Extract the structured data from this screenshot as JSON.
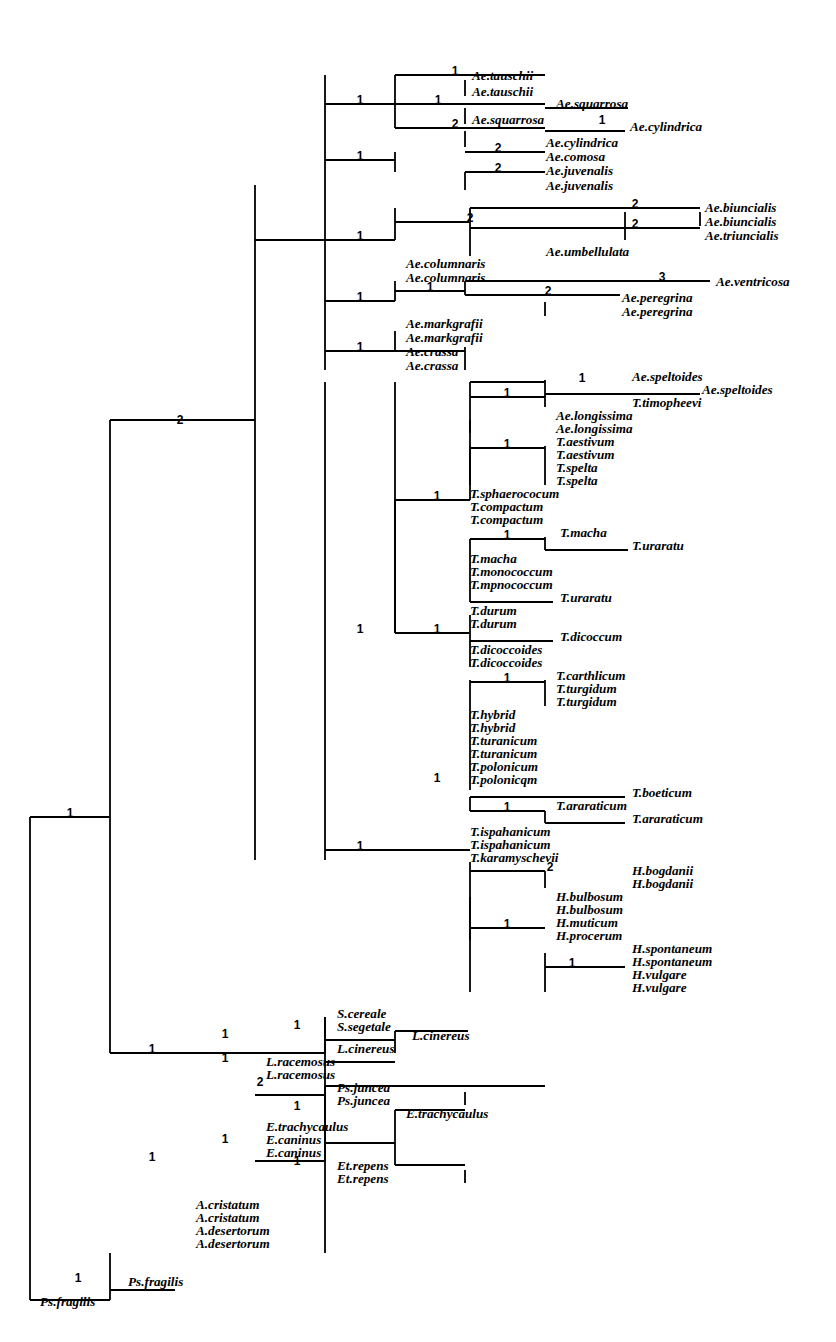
{
  "figure": {
    "type": "phylogenetic-cladogram",
    "orientation": "rectangular-left-to-right",
    "line_color": "#000000",
    "background_color": "#ffffff",
    "branch_length_unit": "steps",
    "tip_count": 78,
    "branch_number_count": 45
  },
  "taxa": [
    {
      "id": "t1",
      "label": "Ae.tauschii",
      "x": 472,
      "y": 80
    },
    {
      "id": "t2",
      "label": "Ae.tauschii",
      "x": 472,
      "y": 96
    },
    {
      "id": "t3",
      "label": "Ae.squarrosa",
      "x": 556,
      "y": 108
    },
    {
      "id": "t4",
      "label": "Ae.squarrosa",
      "x": 472,
      "y": 124
    },
    {
      "id": "t5",
      "label": "Ae.cylindrica",
      "x": 630,
      "y": 131
    },
    {
      "id": "t6",
      "label": "Ae.cylindrica",
      "x": 546,
      "y": 147
    },
    {
      "id": "t7",
      "label": "Ae.comosa",
      "x": 546,
      "y": 161
    },
    {
      "id": "t8",
      "label": "Ae.juvenalis",
      "x": 546,
      "y": 175
    },
    {
      "id": "t9",
      "label": "Ae.juvenalis",
      "x": 546,
      "y": 190
    },
    {
      "id": "t10",
      "label": "Ae.biuncialis",
      "x": 705,
      "y": 212
    },
    {
      "id": "t11",
      "label": "Ae.biuncialis",
      "x": 705,
      "y": 226
    },
    {
      "id": "t12",
      "label": "Ae.triuncialis",
      "x": 705,
      "y": 240
    },
    {
      "id": "t13",
      "label": "Ae.umbellulata",
      "x": 546,
      "y": 256
    },
    {
      "id": "t14",
      "label": "Ae.columnaris",
      "x": 406,
      "y": 268
    },
    {
      "id": "t15",
      "label": "Ae.columnaris",
      "x": 406,
      "y": 282
    },
    {
      "id": "t16",
      "label": "Ae.ventricosa",
      "x": 716,
      "y": 286
    },
    {
      "id": "t17",
      "label": "Ae.peregrina",
      "x": 622,
      "y": 302
    },
    {
      "id": "t18",
      "label": "Ae.peregrina",
      "x": 622,
      "y": 316
    },
    {
      "id": "t19",
      "label": "Ae.markgrafii",
      "x": 406,
      "y": 328
    },
    {
      "id": "t20",
      "label": "Ae.markgrafii",
      "x": 406,
      "y": 342
    },
    {
      "id": "t21",
      "label": "Ae.crassa",
      "x": 406,
      "y": 356
    },
    {
      "id": "t22",
      "label": "Ae.crassa",
      "x": 406,
      "y": 370
    },
    {
      "id": "t23",
      "label": "Ae.speltoides",
      "x": 632,
      "y": 381
    },
    {
      "id": "t24",
      "label": "Ae.speltoides",
      "x": 702,
      "y": 394
    },
    {
      "id": "t25",
      "label": "T.timopheevi",
      "x": 632,
      "y": 407
    },
    {
      "id": "t26",
      "label": "Ae.longissima",
      "x": 556,
      "y": 420
    },
    {
      "id": "t27",
      "label": "Ae.longissima",
      "x": 556,
      "y": 433
    },
    {
      "id": "t28",
      "label": "T.aestivum",
      "x": 556,
      "y": 446
    },
    {
      "id": "t29",
      "label": "T.aestivum",
      "x": 556,
      "y": 459
    },
    {
      "id": "t30",
      "label": "T.spelta",
      "x": 556,
      "y": 472
    },
    {
      "id": "t31",
      "label": "T.spelta",
      "x": 556,
      "y": 485
    },
    {
      "id": "t32",
      "label": "T.sphaerococum",
      "x": 470,
      "y": 498
    },
    {
      "id": "t33",
      "label": "T.compactum",
      "x": 470,
      "y": 511
    },
    {
      "id": "t34",
      "label": "T.compactum",
      "x": 470,
      "y": 524
    },
    {
      "id": "t35",
      "label": "T.macha",
      "x": 560,
      "y": 537
    },
    {
      "id": "t36",
      "label": "T.uraratu",
      "x": 632,
      "y": 550
    },
    {
      "id": "t37",
      "label": "T.macha",
      "x": 470,
      "y": 563
    },
    {
      "id": "t38",
      "label": "T.monococcum",
      "x": 470,
      "y": 576
    },
    {
      "id": "t39",
      "label": "T.mpnococcum",
      "x": 470,
      "y": 589
    },
    {
      "id": "t40",
      "label": "T.uraratu",
      "x": 560,
      "y": 602
    },
    {
      "id": "t41",
      "label": "T.durum",
      "x": 470,
      "y": 615
    },
    {
      "id": "t42",
      "label": "T.durum",
      "x": 470,
      "y": 628
    },
    {
      "id": "t43",
      "label": "T.dicoccum",
      "x": 560,
      "y": 641
    },
    {
      "id": "t44",
      "label": "T.dicoccoides",
      "x": 470,
      "y": 654
    },
    {
      "id": "t45",
      "label": "T.dicoccoides",
      "x": 470,
      "y": 667
    },
    {
      "id": "t46",
      "label": "T.carthlicum",
      "x": 556,
      "y": 680
    },
    {
      "id": "t47",
      "label": "T.turgidum",
      "x": 556,
      "y": 693
    },
    {
      "id": "t48",
      "label": "T.turgidum",
      "x": 556,
      "y": 706
    },
    {
      "id": "t49",
      "label": "T.hybrid",
      "x": 470,
      "y": 719
    },
    {
      "id": "t50",
      "label": "T.hybrid",
      "x": 470,
      "y": 732
    },
    {
      "id": "t51",
      "label": "T.turanicum",
      "x": 470,
      "y": 745
    },
    {
      "id": "t52",
      "label": "T.turanicum",
      "x": 470,
      "y": 758
    },
    {
      "id": "t53",
      "label": "T.polonicum",
      "x": 470,
      "y": 771
    },
    {
      "id": "t54",
      "label": "T.polonicqm",
      "x": 470,
      "y": 784
    },
    {
      "id": "t55",
      "label": "T.boeticum",
      "x": 632,
      "y": 797
    },
    {
      "id": "t56",
      "label": "T.araraticum",
      "x": 556,
      "y": 810
    },
    {
      "id": "t57",
      "label": "T.araraticum",
      "x": 632,
      "y": 823
    },
    {
      "id": "t58",
      "label": "T.ispahanicum",
      "x": 470,
      "y": 836
    },
    {
      "id": "t59",
      "label": "T.ispahanicum",
      "x": 470,
      "y": 849
    },
    {
      "id": "t60",
      "label": "T.karamyschevii",
      "x": 470,
      "y": 862
    },
    {
      "id": "t61",
      "label": "H.bogdanii",
      "x": 632,
      "y": 875
    },
    {
      "id": "t62",
      "label": "H.bogdanii",
      "x": 632,
      "y": 888
    },
    {
      "id": "t63",
      "label": "H.bulbosum",
      "x": 556,
      "y": 901
    },
    {
      "id": "t64",
      "label": "H.bulbosum",
      "x": 556,
      "y": 914
    },
    {
      "id": "t65",
      "label": "H.muticum",
      "x": 556,
      "y": 927
    },
    {
      "id": "t66",
      "label": "H.procerum",
      "x": 556,
      "y": 940
    },
    {
      "id": "t67",
      "label": "H.spontaneum",
      "x": 632,
      "y": 953
    },
    {
      "id": "t68",
      "label": "H.spontaneum",
      "x": 632,
      "y": 966
    },
    {
      "id": "t69",
      "label": "H.vulgare",
      "x": 632,
      "y": 979
    },
    {
      "id": "t70",
      "label": "H.vulgare",
      "x": 632,
      "y": 992
    },
    {
      "id": "t71",
      "label": "S.cereale",
      "x": 337,
      "y": 1018
    },
    {
      "id": "t72",
      "label": "S.segetale",
      "x": 337,
      "y": 1031
    },
    {
      "id": "t73",
      "label": "L.cinereus",
      "x": 412,
      "y": 1040
    },
    {
      "id": "t74",
      "label": "L.cinereus",
      "x": 337,
      "y": 1053
    },
    {
      "id": "t75",
      "label": "L.racemosus",
      "x": 266,
      "y": 1066
    },
    {
      "id": "t76",
      "label": "L.racemosus",
      "x": 266,
      "y": 1079
    },
    {
      "id": "t77",
      "label": "Ps.juncea",
      "x": 337,
      "y": 1092
    },
    {
      "id": "t78",
      "label": "Ps.juncea",
      "x": 337,
      "y": 1105
    },
    {
      "id": "t79",
      "label": "E.trachycaulus",
      "x": 406,
      "y": 1118
    },
    {
      "id": "t80",
      "label": "E.trachycaulus",
      "x": 266,
      "y": 1131
    },
    {
      "id": "t81",
      "label": "E.caninus",
      "x": 266,
      "y": 1144
    },
    {
      "id": "t82",
      "label": "E.caninus",
      "x": 266,
      "y": 1157
    },
    {
      "id": "t83",
      "label": "Et.repens",
      "x": 337,
      "y": 1170
    },
    {
      "id": "t84",
      "label": "Et.repens",
      "x": 337,
      "y": 1183
    },
    {
      "id": "t85",
      "label": "A.cristatum",
      "x": 196,
      "y": 1209
    },
    {
      "id": "t86",
      "label": "A.cristatum",
      "x": 196,
      "y": 1222
    },
    {
      "id": "t87",
      "label": "A.desertorum",
      "x": 196,
      "y": 1235
    },
    {
      "id": "t88",
      "label": "A.desertorum",
      "x": 196,
      "y": 1248
    },
    {
      "id": "t89",
      "label": "Ps.fragilis",
      "x": 128,
      "y": 1286
    },
    {
      "id": "t90",
      "label": "Ps.fragilis",
      "x": 40,
      "y": 1306
    }
  ],
  "branch_numbers": [
    {
      "id": "n1",
      "label": "1",
      "x": 455,
      "y": 75
    },
    {
      "id": "n2",
      "label": "1",
      "x": 360,
      "y": 104
    },
    {
      "id": "n3",
      "label": "1",
      "x": 438,
      "y": 104
    },
    {
      "id": "n4",
      "label": "2",
      "x": 455,
      "y": 128
    },
    {
      "id": "n5",
      "label": "1",
      "x": 602,
      "y": 124
    },
    {
      "id": "n6",
      "label": "2",
      "x": 498,
      "y": 152
    },
    {
      "id": "n7",
      "label": "1",
      "x": 360,
      "y": 160
    },
    {
      "id": "n8",
      "label": "2",
      "x": 498,
      "y": 172
    },
    {
      "id": "n9",
      "label": "2",
      "x": 635,
      "y": 208
    },
    {
      "id": "n10",
      "label": "2",
      "x": 635,
      "y": 228
    },
    {
      "id": "n11",
      "label": "2",
      "x": 470,
      "y": 222
    },
    {
      "id": "n12",
      "label": "1",
      "x": 360,
      "y": 240
    },
    {
      "id": "n13",
      "label": "3",
      "x": 662,
      "y": 281
    },
    {
      "id": "n14",
      "label": "2",
      "x": 548,
      "y": 295
    },
    {
      "id": "n15",
      "label": "1",
      "x": 430,
      "y": 291
    },
    {
      "id": "n16",
      "label": "1",
      "x": 360,
      "y": 301
    },
    {
      "id": "n17",
      "label": "1",
      "x": 360,
      "y": 351
    },
    {
      "id": "n18",
      "label": "1",
      "x": 582,
      "y": 382
    },
    {
      "id": "n19",
      "label": "1",
      "x": 507,
      "y": 397
    },
    {
      "id": "n20",
      "label": "1",
      "x": 507,
      "y": 448
    },
    {
      "id": "n21",
      "label": "1",
      "x": 437,
      "y": 500
    },
    {
      "id": "n22",
      "label": "1",
      "x": 507,
      "y": 539
    },
    {
      "id": "n23",
      "label": "1",
      "x": 360,
      "y": 633
    },
    {
      "id": "n24",
      "label": "1",
      "x": 437,
      "y": 633
    },
    {
      "id": "n25",
      "label": "1",
      "x": 507,
      "y": 682
    },
    {
      "id": "n26",
      "label": "1",
      "x": 437,
      "y": 782
    },
    {
      "id": "n27",
      "label": "1",
      "x": 507,
      "y": 811
    },
    {
      "id": "n28",
      "label": "2",
      "x": 550,
      "y": 871
    },
    {
      "id": "n29",
      "label": "1",
      "x": 507,
      "y": 928
    },
    {
      "id": "n30",
      "label": "1",
      "x": 572,
      "y": 967
    },
    {
      "id": "n31",
      "label": "2",
      "x": 180,
      "y": 424
    },
    {
      "id": "n32",
      "label": "1",
      "x": 360,
      "y": 850
    },
    {
      "id": "n33",
      "label": "1",
      "x": 70,
      "y": 817
    },
    {
      "id": "n34",
      "label": "1",
      "x": 225,
      "y": 1038
    },
    {
      "id": "n35",
      "label": "1",
      "x": 297,
      "y": 1029
    },
    {
      "id": "n36",
      "label": "1",
      "x": 225,
      "y": 1062
    },
    {
      "id": "n37",
      "label": "1",
      "x": 152,
      "y": 1053
    },
    {
      "id": "n38",
      "label": "2",
      "x": 260,
      "y": 1086
    },
    {
      "id": "n39",
      "label": "1",
      "x": 297,
      "y": 1110
    },
    {
      "id": "n40",
      "label": "1",
      "x": 225,
      "y": 1143
    },
    {
      "id": "n41",
      "label": "1",
      "x": 297,
      "y": 1165
    },
    {
      "id": "n42",
      "label": "1",
      "x": 152,
      "y": 1161
    },
    {
      "id": "n43",
      "label": "1",
      "x": 78,
      "y": 1282
    }
  ],
  "segments": {
    "description": "Cladogram line segments in pixel coordinates. h = horizontal [x1,x2,y]; v = vertical [x,y1,y2].",
    "h": [
      [
        30,
        110,
        1300
      ],
      [
        30,
        110,
        817
      ],
      [
        110,
        255,
        420
      ],
      [
        110,
        255,
        1053
      ],
      [
        110,
        175,
        1290
      ],
      [
        255,
        325,
        240
      ],
      [
        255,
        325,
        1095
      ],
      [
        325,
        395,
        104
      ],
      [
        325,
        395,
        160
      ],
      [
        325,
        395,
        240
      ],
      [
        325,
        395,
        301
      ],
      [
        325,
        395,
        351
      ],
      [
        395,
        465,
        75
      ],
      [
        395,
        465,
        104
      ],
      [
        395,
        465,
        128
      ],
      [
        465,
        545,
        75
      ],
      [
        465,
        545,
        104
      ],
      [
        545,
        628,
        108
      ],
      [
        465,
        545,
        128
      ],
      [
        545,
        625,
        131
      ],
      [
        465,
        545,
        152
      ],
      [
        465,
        545,
        172
      ],
      [
        395,
        470,
        222
      ],
      [
        470,
        700,
        208
      ],
      [
        470,
        700,
        228
      ],
      [
        395,
        465,
        291
      ],
      [
        465,
        710,
        281
      ],
      [
        465,
        620,
        295
      ],
      [
        395,
        465,
        351
      ],
      [
        325,
        470,
        850
      ],
      [
        395,
        470,
        500
      ],
      [
        470,
        545,
        382
      ],
      [
        545,
        700,
        394
      ],
      [
        470,
        545,
        397
      ],
      [
        470,
        545,
        448
      ],
      [
        470,
        545,
        539
      ],
      [
        545,
        628,
        550
      ],
      [
        470,
        553,
        602
      ],
      [
        470,
        553,
        641
      ],
      [
        395,
        470,
        633
      ],
      [
        470,
        545,
        682
      ],
      [
        470,
        625,
        797
      ],
      [
        470,
        545,
        811
      ],
      [
        545,
        625,
        823
      ],
      [
        470,
        545,
        871
      ],
      [
        470,
        545,
        928
      ],
      [
        545,
        625,
        967
      ],
      [
        255,
        325,
        1053
      ],
      [
        325,
        395,
        1040
      ],
      [
        395,
        468,
        1031
      ],
      [
        325,
        395,
        1062
      ],
      [
        325,
        545,
        1086
      ],
      [
        325,
        395,
        1143
      ],
      [
        395,
        465,
        1110
      ],
      [
        395,
        465,
        1165
      ],
      [
        255,
        325,
        1161
      ]
    ],
    "v": [
      [
        30,
        817,
        1300
      ],
      [
        110,
        420,
        1053
      ],
      [
        255,
        185,
        860
      ],
      [
        325,
        75,
        370
      ],
      [
        325,
        382,
        860
      ],
      [
        325,
        1017,
        1161
      ],
      [
        395,
        75,
        128
      ],
      [
        395,
        152,
        172
      ],
      [
        395,
        208,
        240
      ],
      [
        395,
        281,
        301
      ],
      [
        395,
        331,
        351
      ],
      [
        395,
        382,
        633
      ],
      [
        395,
        500,
        633
      ],
      [
        465,
        80,
        96
      ],
      [
        465,
        108,
        124
      ],
      [
        465,
        131,
        147
      ],
      [
        465,
        172,
        190
      ],
      [
        470,
        208,
        256
      ],
      [
        465,
        281,
        295
      ],
      [
        465,
        347,
        370
      ],
      [
        470,
        382,
        500
      ],
      [
        470,
        420,
        433
      ],
      [
        470,
        446,
        485
      ],
      [
        470,
        539,
        602
      ],
      [
        470,
        615,
        667
      ],
      [
        470,
        680,
        790
      ],
      [
        470,
        797,
        811
      ],
      [
        470,
        862,
        940
      ],
      [
        470,
        897,
        992
      ],
      [
        545,
        302,
        316
      ],
      [
        545,
        380,
        407
      ],
      [
        545,
        446,
        485
      ],
      [
        545,
        537,
        550
      ],
      [
        545,
        680,
        706
      ],
      [
        545,
        811,
        823
      ],
      [
        545,
        871,
        888
      ],
      [
        545,
        953,
        992
      ],
      [
        625,
        212,
        240
      ],
      [
        700,
        212,
        226
      ],
      [
        325,
        1017,
        1053
      ],
      [
        395,
        1031,
        1053
      ],
      [
        325,
        1086,
        1165
      ],
      [
        395,
        1110,
        1165
      ],
      [
        465,
        1092,
        1105
      ],
      [
        465,
        1170,
        1183
      ],
      [
        325,
        1165,
        1253
      ],
      [
        110,
        1253,
        1300
      ]
    ]
  }
}
